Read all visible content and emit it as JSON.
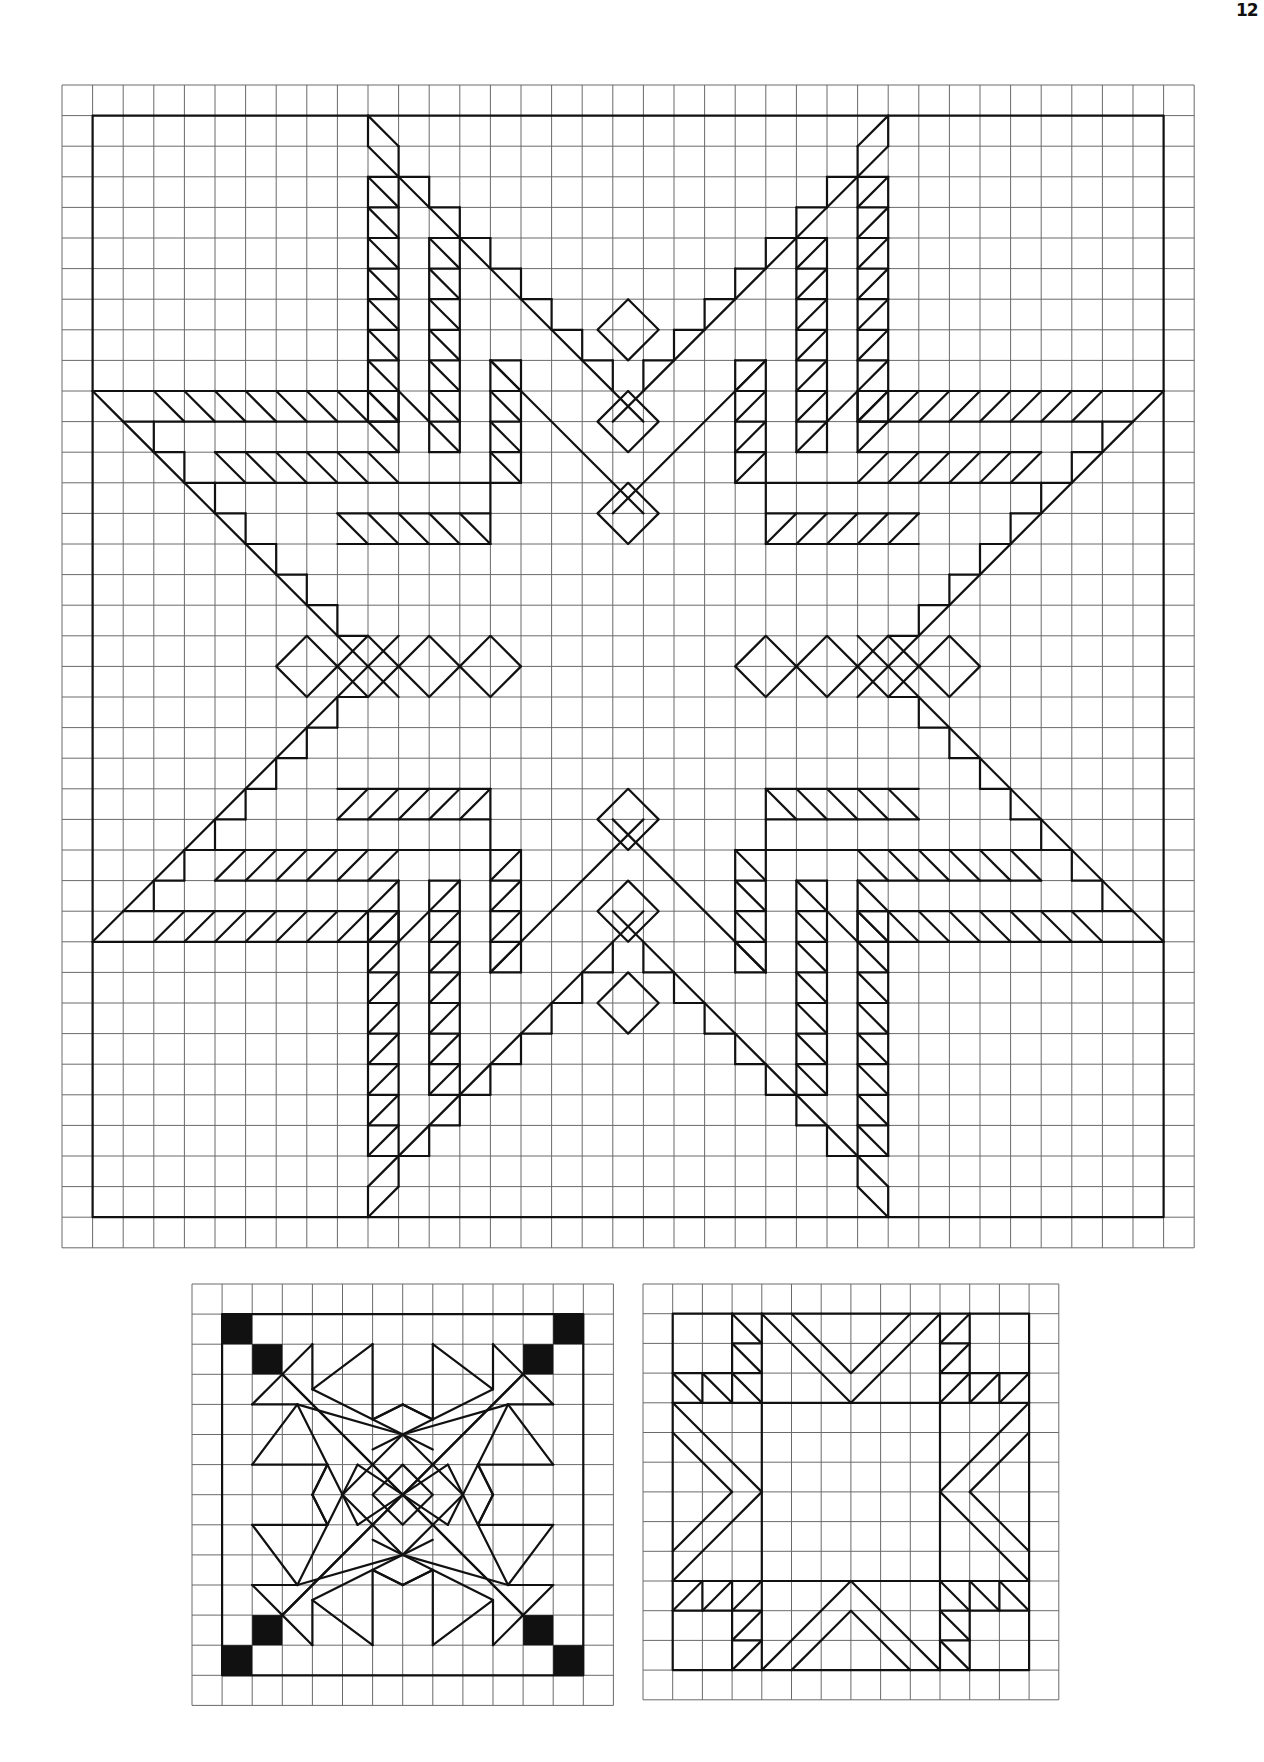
{
  "page": {
    "number": "12",
    "background": "#ffffff",
    "ink_color": "#111111",
    "grid_color": "#6a6a6a"
  },
  "main_pattern": {
    "name": "eight-pointed star quilt block",
    "grid": {
      "x": 62,
      "y": 85,
      "cell": 30.6,
      "cols": 37,
      "rows": 38
    },
    "border": {
      "from": [
        1,
        1
      ],
      "to": [
        36,
        37
      ]
    }
  },
  "small_pattern_left": {
    "name": "star block with black corner squares",
    "grid": {
      "x": 192,
      "y": 1284,
      "cell": 30.1,
      "cols": 14,
      "rows": 14
    },
    "border": {
      "from": [
        1,
        1
      ],
      "to": [
        13,
        13
      ]
    },
    "black_squares": [
      [
        1,
        1
      ],
      [
        2,
        2
      ],
      [
        12,
        1
      ],
      [
        11,
        2
      ],
      [
        1,
        12
      ],
      [
        2,
        11
      ],
      [
        12,
        12
      ],
      [
        11,
        11
      ]
    ]
  },
  "small_pattern_right": {
    "name": "square block with chevron arrows",
    "grid": {
      "x": 643,
      "y": 1284,
      "cell": 29.7,
      "cols": 14,
      "rows": 14
    },
    "border": {
      "from": [
        1,
        1
      ],
      "to": [
        13,
        13
      ]
    }
  }
}
